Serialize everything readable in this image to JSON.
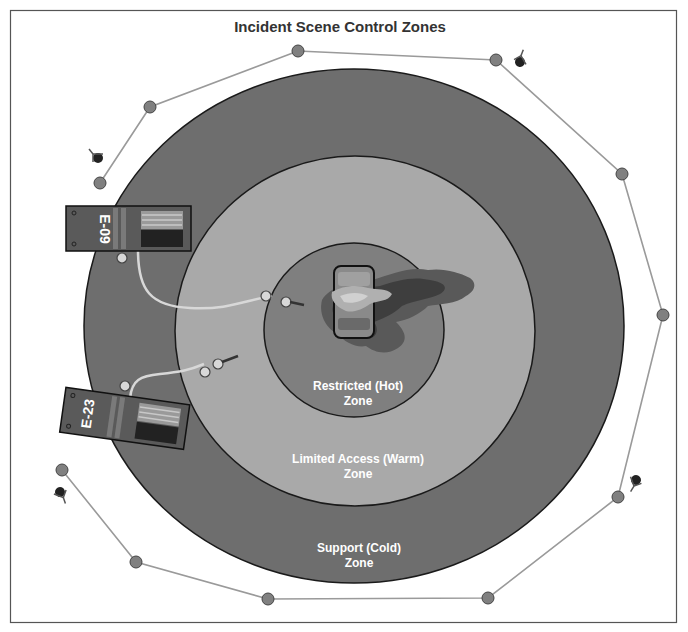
{
  "title": "Incident Scene Control Zones",
  "zones": [
    {
      "id": "hot",
      "line1": "Restricted (Hot)",
      "line2": "Zone",
      "color": "#7f7f7f"
    },
    {
      "id": "warm",
      "line1": "Limited Access (Warm)",
      "line2": "Zone",
      "color": "#a9a9a9"
    },
    {
      "id": "cold",
      "line1": "Support (Cold)",
      "line2": "Zone",
      "color": "#6e6e6e"
    }
  ],
  "apparatus": [
    {
      "id": "engine-09",
      "label": "E-09"
    },
    {
      "id": "engine-23",
      "label": "E-23"
    }
  ],
  "colors": {
    "cold": "#6e6e6e",
    "warm": "#a9a9a9",
    "hot": "#7f7f7f",
    "perimeter_line": "#9a9a9a",
    "cone": "#808080",
    "frame": "#555555",
    "smoke_dark": "#3e3e3e",
    "smoke_mid": "#5a5a5a",
    "flame": "#a8a8a8"
  }
}
